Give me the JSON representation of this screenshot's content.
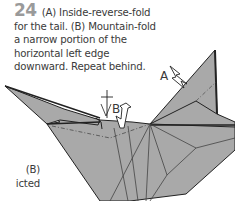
{
  "step": {
    "number": "24",
    "lines": [
      "(A) Inside-reverse-fold",
      "for the tail. (B) Mountain-fold",
      "a narrow portion of the",
      "horizontal left edge",
      "downward. Repeat behind."
    ]
  },
  "adjacent_text": {
    "lines": [
      "(B)",
      "icted",
      ". . ."
    ]
  },
  "diagram": {
    "labels": {
      "a": "A",
      "b": "B"
    },
    "colors": {
      "paper": "#a9a9a9",
      "line": "#222222",
      "crease": "#555555",
      "arrow_fill": "#ffffff"
    }
  }
}
